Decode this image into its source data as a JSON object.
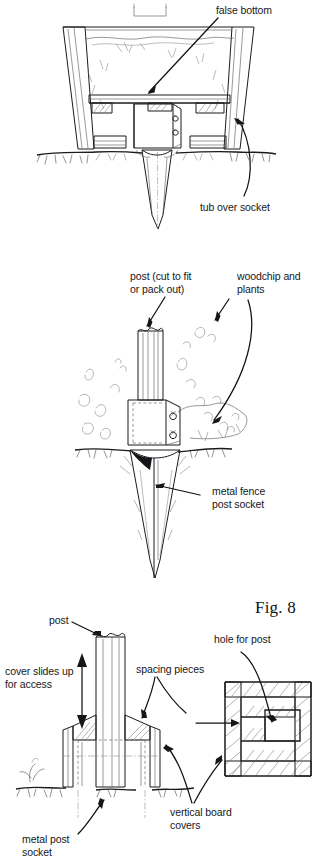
{
  "figure": {
    "caption": "Fig. 8",
    "panels": [
      {
        "name": "tub-over-socket-section",
        "labels": [
          {
            "key": "false_bottom",
            "text": "false bottom"
          },
          {
            "key": "tub_over_socket",
            "text": "tub over socket"
          }
        ]
      },
      {
        "name": "metal-fence-post-socket",
        "labels": [
          {
            "key": "post_cut_line1",
            "text": "post (cut to fit"
          },
          {
            "key": "post_cut_line2",
            "text": "or pack out)"
          },
          {
            "key": "woodchip_line1",
            "text": "woodchip and"
          },
          {
            "key": "woodchip_line2",
            "text": "plants"
          },
          {
            "key": "metal_fence_line1",
            "text": "metal fence"
          },
          {
            "key": "metal_fence_line2",
            "text": "post socket"
          }
        ]
      },
      {
        "name": "post-cover-assembly",
        "labels": [
          {
            "key": "post",
            "text": "post"
          },
          {
            "key": "cover_slides_line1",
            "text": "cover slides up"
          },
          {
            "key": "cover_slides_line2",
            "text": "for access"
          },
          {
            "key": "spacing_pieces",
            "text": "spacing pieces"
          },
          {
            "key": "hole_for_post",
            "text": "hole for post"
          },
          {
            "key": "vertical_board_line1",
            "text": "vertical board"
          },
          {
            "key": "vertical_board_line2",
            "text": "covers"
          },
          {
            "key": "metal_post_line1",
            "text": "metal post"
          },
          {
            "key": "metal_post_line2",
            "text": "socket"
          }
        ]
      }
    ]
  },
  "labels": {
    "false_bottom": "false bottom",
    "tub_over_socket": "tub over socket",
    "post_cut_l1": "post (cut to fit",
    "post_cut_l2": "or pack out)",
    "woodchip_l1": "woodchip and",
    "woodchip_l2": "plants",
    "metal_fence_l1": "metal fence",
    "metal_fence_l2": "post socket",
    "post": "post",
    "cover_slides_l1": "cover slides up",
    "cover_slides_l2": "for access",
    "spacing_pieces": "spacing pieces",
    "hole_for_post": "hole for post",
    "vertical_board_l1": "vertical board",
    "vertical_board_l2": "covers",
    "metal_post_l1": "metal post",
    "metal_post_l2": "socket",
    "fig_caption": "Fig. 8"
  },
  "colors": {
    "ink": "#1b1b1e",
    "paper": "#ffffff",
    "light_fill": "#f4f4f2",
    "shadow_fill": "#e9e9e6",
    "text": "#17171a"
  }
}
